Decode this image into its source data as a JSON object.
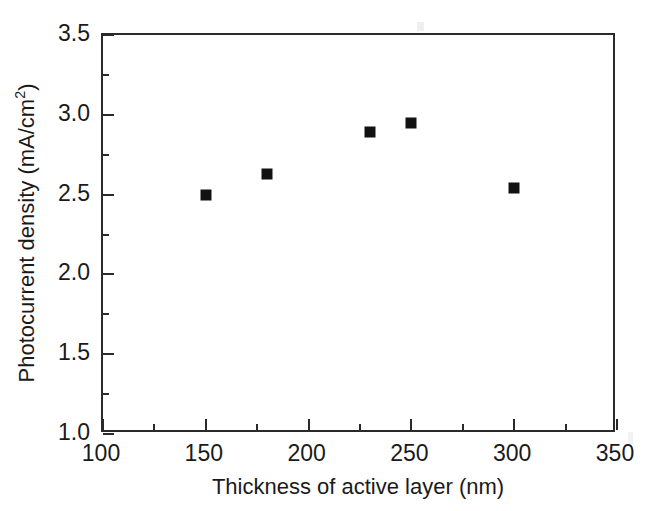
{
  "chart_data": {
    "type": "scatter",
    "title": "",
    "xlabel": "Thickness of active layer (nm)",
    "ylabel_full": "Photocurrent density (mA/cm2)",
    "ylabel_main": "Photocurrent density (mA/cm",
    "ylabel_sup": "2",
    "ylabel_close": ")",
    "xlim": [
      100,
      350
    ],
    "ylim": [
      1.0,
      3.5
    ],
    "grid": false,
    "legend": "none",
    "x_major_step": 50,
    "x_minor_step": 25,
    "y_major_step": 0.5,
    "y_minor_step": 0.25,
    "marker_style": "filled-square",
    "marker_color": "#121212",
    "axis_color": "#2a2a2a",
    "x_ticks": [
      {
        "value": 100,
        "label": "100"
      },
      {
        "value": 150,
        "label": "150"
      },
      {
        "value": 200,
        "label": "200"
      },
      {
        "value": 250,
        "label": "250"
      },
      {
        "value": 300,
        "label": "300"
      },
      {
        "value": 350,
        "label": "350"
      }
    ],
    "x_minor_ticks": [
      125,
      175,
      225,
      275,
      325
    ],
    "y_ticks": [
      {
        "value": 1.0,
        "label": "1.0"
      },
      {
        "value": 1.5,
        "label": "1.5"
      },
      {
        "value": 2.0,
        "label": "2.0"
      },
      {
        "value": 2.5,
        "label": "2.5"
      },
      {
        "value": 3.0,
        "label": "3.0"
      },
      {
        "value": 3.5,
        "label": "3.5"
      }
    ],
    "y_minor_ticks": [
      1.25,
      1.75,
      2.25,
      2.75,
      3.25
    ],
    "x": [
      150,
      180,
      230,
      250,
      300
    ],
    "values": [
      2.5,
      2.63,
      2.89,
      2.95,
      2.54
    ],
    "points": [
      {
        "x": 150,
        "y": 2.5
      },
      {
        "x": 180,
        "y": 2.63
      },
      {
        "x": 230,
        "y": 2.89
      },
      {
        "x": 250,
        "y": 2.95
      },
      {
        "x": 300,
        "y": 2.54
      }
    ]
  }
}
